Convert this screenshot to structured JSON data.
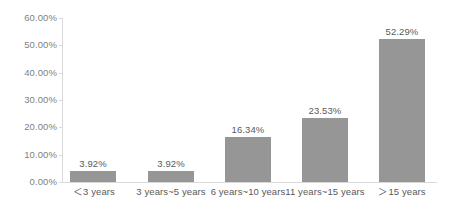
{
  "chart_data": {
    "type": "bar",
    "title": "",
    "subtitle": "",
    "xlabel": "",
    "ylabel": "",
    "categories": [
      "＜3 years",
      "3 years~5 years",
      "6 years~10 years",
      "11 years~15 years",
      "＞15 years"
    ],
    "values": [
      3.92,
      3.92,
      16.34,
      23.53,
      52.29
    ],
    "data_labels": [
      "3.92%",
      "3.92%",
      "16.34%",
      "23.53%",
      "52.29%"
    ],
    "ylim": [
      0,
      60
    ],
    "ytick_values": [
      0,
      10,
      20,
      30,
      40,
      50,
      60
    ],
    "ytick_labels": [
      "0.00%",
      "10.00%",
      "20.00%",
      "30.00%",
      "40.00%",
      "50.00%",
      "60.00%"
    ],
    "grid": false,
    "legend": null,
    "legend_position": "none",
    "series": [
      {
        "name": "",
        "values": [
          3.92,
          3.92,
          16.34,
          23.53,
          52.29
        ],
        "color": "#969696"
      }
    ],
    "colors": {
      "bar": "#969696",
      "axis_line": "#d9d9d9",
      "tick_label": "#7f7f7f",
      "data_label": "#5a5a5a",
      "category_label": "#5a5a5a",
      "background": "#ffffff"
    }
  }
}
